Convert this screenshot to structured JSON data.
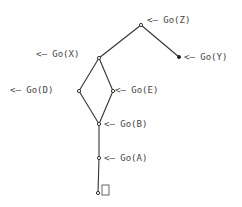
{
  "diagram": {
    "type": "tree",
    "nodes": [
      {
        "id": "Z",
        "label": "<— Go(Z)",
        "x": 141,
        "y": 25
      },
      {
        "id": "Y",
        "label": "<— Go(Y)",
        "x": 179,
        "y": 57
      },
      {
        "id": "X",
        "label": "<— Go(X)",
        "x": 99,
        "y": 58
      },
      {
        "id": "D",
        "label": "<— Go(D)",
        "x": 79,
        "y": 91
      },
      {
        "id": "E",
        "label": "<— Go(E)",
        "x": 113,
        "y": 91
      },
      {
        "id": "B",
        "label": "<— Go(B)",
        "x": 99,
        "y": 124
      },
      {
        "id": "A",
        "label": "<— Go(A)",
        "x": 99,
        "y": 158
      },
      {
        "id": "root",
        "label": "□",
        "x": 98,
        "y": 193
      }
    ],
    "edges": [
      [
        "Z",
        "X"
      ],
      [
        "Z",
        "Y"
      ],
      [
        "X",
        "D"
      ],
      [
        "X",
        "E"
      ],
      [
        "D",
        "B"
      ],
      [
        "E",
        "B"
      ],
      [
        "B",
        "A"
      ],
      [
        "A",
        "root"
      ]
    ],
    "labels": {
      "Z": "<— Go(Z)",
      "Y": "<— Go(Y)",
      "X": "<— Go(X)",
      "D": "<— Go(D)",
      "E": "<— Go(E)",
      "B": "<— Go(B)",
      "A": "<— Go(A)"
    }
  }
}
